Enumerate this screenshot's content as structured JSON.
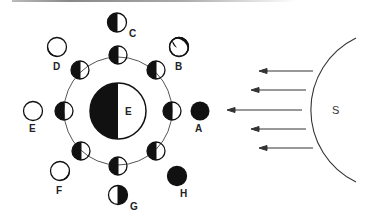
{
  "diagram": {
    "type": "moon-phases",
    "colors": {
      "ink": "#111111",
      "orbit": "#555555",
      "background": "#ffffff"
    },
    "earth": {
      "label": "E"
    },
    "sun": {
      "label": "S"
    },
    "outer_phases": [
      {
        "label": "A",
        "phase": "new moon"
      },
      {
        "label": "B",
        "phase": "waxing crescent"
      },
      {
        "label": "C",
        "phase": "first quarter"
      },
      {
        "label": "D",
        "phase": "waxing gibbous"
      },
      {
        "label": "E",
        "phase": "full moon"
      },
      {
        "label": "F",
        "phase": "waning gibbous"
      },
      {
        "label": "G",
        "phase": "third quarter"
      },
      {
        "label": "H",
        "phase": "waning crescent"
      }
    ],
    "sunlight_arrows": 5
  }
}
